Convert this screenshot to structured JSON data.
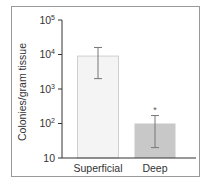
{
  "chart_data": {
    "type": "bar",
    "title": "",
    "xlabel": "",
    "ylabel": "Colonies/gram tissue",
    "yscale": "log",
    "ylim": [
      10,
      100000
    ],
    "yticks": [
      10,
      100,
      1000,
      10000,
      100000
    ],
    "ytick_labels": [
      "10",
      "10^2",
      "10^3",
      "10^4",
      "10^5"
    ],
    "categories": [
      "Superficial",
      "Deep"
    ],
    "values": [
      9000,
      100
    ],
    "error_low": [
      2000,
      20
    ],
    "error_high": [
      16000,
      170
    ],
    "bar_colors": [
      "#f4f4f4",
      "#c8c8c8"
    ],
    "annotations": [
      {
        "category": "Deep",
        "text": "*"
      }
    ],
    "grid": false,
    "legend": null
  }
}
